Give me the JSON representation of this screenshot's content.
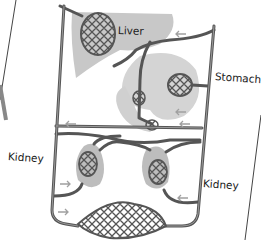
{
  "diagram": {
    "type": "circulatory system schematic",
    "labels": {
      "liver": "Liver",
      "stomach": "Stomach",
      "kidney_left": "Kidney",
      "kidney_right": "Kidney"
    },
    "colors": {
      "organ_fill": "#c8c8c8",
      "vessel": "#555555",
      "vessel_highlight": "#9a9a9a",
      "arrow": "#a0a0a0",
      "background": "#ffffff"
    }
  }
}
